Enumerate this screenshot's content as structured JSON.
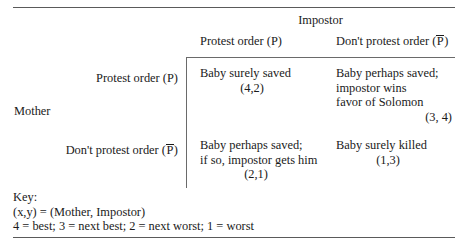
{
  "figure": {
    "type": "game-payoff-matrix",
    "column_player": "Impostor",
    "row_player": "Mother",
    "column_headers": [
      {
        "prefix": "Protest order (",
        "symbol": "P",
        "negated": false,
        "suffix": ")"
      },
      {
        "prefix": "Don't protest order (",
        "symbol": "P",
        "negated": true,
        "suffix": ")"
      }
    ],
    "row_headers": [
      {
        "prefix": "Protest order (",
        "symbol": "P",
        "negated": false,
        "suffix": ")"
      },
      {
        "prefix": "Don't protest order (",
        "symbol": "P",
        "negated": true,
        "suffix": ")"
      }
    ],
    "cells": [
      {
        "row": 0,
        "col": 0,
        "lines": [
          "Baby surely saved"
        ],
        "payoff": "(4,2)",
        "mother_payoff": 4,
        "impostor_payoff": 2
      },
      {
        "row": 0,
        "col": 1,
        "lines": [
          "Baby perhaps saved;",
          "impostor wins",
          "favor of Solomon"
        ],
        "payoff": "(3, 4)",
        "mother_payoff": 3,
        "impostor_payoff": 4
      },
      {
        "row": 1,
        "col": 0,
        "lines": [
          "Baby perhaps saved;",
          "if so, impostor gets him"
        ],
        "payoff": "(2,1)",
        "mother_payoff": 2,
        "impostor_payoff": 1
      },
      {
        "row": 1,
        "col": 1,
        "lines": [
          "Baby surely killed"
        ],
        "payoff": "(1,3)",
        "mother_payoff": 1,
        "impostor_payoff": 3
      }
    ],
    "key": {
      "title": "Key:",
      "tuple_line": "(x,y) = (Mother, Impostor)",
      "scale_line": "4 = best; 3 = next best; 2 = next worst; 1 = worst"
    }
  }
}
